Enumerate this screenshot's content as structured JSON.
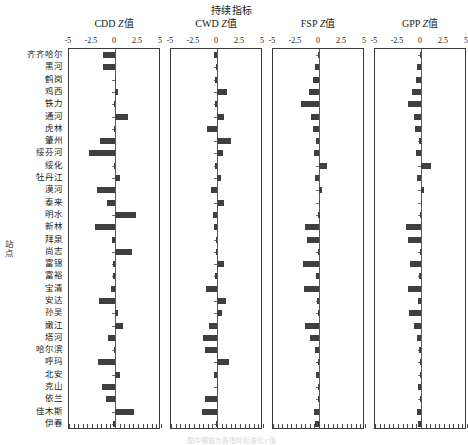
{
  "figure": {
    "suptitle": "持续指标",
    "y_axis_label": "站点",
    "caption": "图中横轴为各指标标准化Z值",
    "tick_labels": [
      "-5",
      "-2.5",
      "0",
      "2.5",
      "5"
    ],
    "tick_values": [
      -5,
      -2.5,
      0,
      2.5,
      5
    ]
  },
  "panels": [
    {
      "key": "CDD",
      "title_main": "CDD ",
      "title_italic": "Z",
      "title_tail": "值"
    },
    {
      "key": "CWD",
      "title_main": "CWD ",
      "title_italic": "Z",
      "title_tail": "值"
    },
    {
      "key": "FSP",
      "title_main": "FSP ",
      "title_italic": "Z",
      "title_tail": "值"
    },
    {
      "key": "GPP",
      "title_main": "GPP ",
      "title_italic": "Z",
      "title_tail": "值"
    }
  ],
  "chart_data": {
    "type": "bar",
    "orientation": "horizontal",
    "title": "持续指标",
    "xlabel": "",
    "ylabel": "站点",
    "xlim": [
      -5,
      5
    ],
    "xticks": [
      -5,
      -2.5,
      0,
      2.5,
      5
    ],
    "grid": false,
    "legend": "none",
    "panels": [
      "CDD Z值",
      "CWD Z值",
      "FSP Z值",
      "GPP Z值"
    ],
    "categories": [
      "齐齐哈尔",
      "黑河",
      "鹤岗",
      "鸡西",
      "铁力",
      "通河",
      "虎林",
      "肇州",
      "绥芬河",
      "绥化",
      "牡丹江",
      "漠河",
      "泰来",
      "明水",
      "新林",
      "拜泉",
      "尚志",
      "富锦",
      "富裕",
      "宝清",
      "安达",
      "孙吴",
      "嫩江",
      "塔河",
      "哈尔滨",
      "呼玛",
      "北安",
      "克山",
      "依兰",
      "佳木斯",
      "伊春"
    ],
    "series": [
      {
        "name": "CDD Z值",
        "values": [
          -1.3,
          -1.35,
          -0.05,
          0.3,
          -0.12,
          1.45,
          -0.1,
          -1.6,
          -2.85,
          -0.1,
          0.55,
          -1.95,
          -0.9,
          2.25,
          -2.2,
          -0.3,
          1.85,
          -0.18,
          -0.2,
          -0.45,
          -1.75,
          0.35,
          0.85,
          -0.75,
          -0.08,
          -1.9,
          0.55,
          -1.45,
          -0.95,
          2.05,
          -0.25
        ]
      },
      {
        "name": "CWD Z值",
        "values": [
          -0.3,
          -0.12,
          -0.22,
          1.1,
          -0.25,
          0.8,
          -1.05,
          1.55,
          0.7,
          -0.18,
          0.45,
          -0.6,
          0.75,
          -0.45,
          -0.3,
          -0.15,
          -0.1,
          0.8,
          -0.18,
          -1.25,
          1.0,
          0.55,
          -0.9,
          -1.5,
          -1.35,
          1.35,
          -0.35,
          0.08,
          -1.3,
          -1.6,
          -0.1
        ]
      },
      {
        "name": "FSP Z值",
        "values": [
          -0.12,
          -0.45,
          -0.7,
          -1.1,
          -1.95,
          -0.9,
          -0.6,
          -0.35,
          -0.55,
          0.9,
          -0.4,
          0.3,
          -0.05,
          -0.06,
          -1.5,
          -1.35,
          -0.08,
          -1.7,
          -0.35,
          -1.6,
          -0.2,
          -0.12,
          -1.55,
          -0.95,
          -0.45,
          -0.1,
          -0.3,
          -0.15,
          -0.08,
          -0.5,
          -0.4
        ]
      },
      {
        "name": "GPP Z值",
        "values": [
          -0.1,
          -0.4,
          -0.55,
          -1.0,
          -1.4,
          -0.75,
          -0.65,
          -0.25,
          -0.55,
          1.05,
          -0.45,
          0.35,
          -0.05,
          -0.08,
          -1.65,
          -1.45,
          -0.1,
          -1.25,
          -0.25,
          -1.45,
          -0.3,
          -1.3,
          -0.8,
          -0.45,
          -0.2,
          -0.12,
          -0.1,
          -0.3,
          -0.15,
          -0.45,
          -0.35
        ]
      }
    ]
  }
}
